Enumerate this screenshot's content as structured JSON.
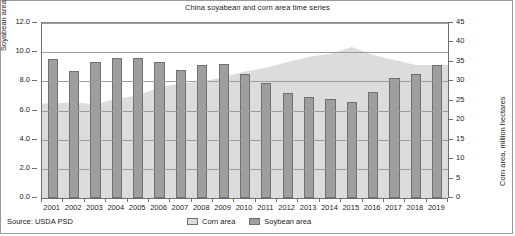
{
  "chart": {
    "title": "China soyabean and corn area time series",
    "source": "Source: USDA PSD",
    "legend": {
      "corn_label": "Corn area",
      "soybean_label": "Soybean area"
    },
    "axis_left_title": "Soyabean area, million hectares",
    "axis_right_title": "Corn area, million hectares",
    "colors": {
      "soybean_bar_fill": "#9e9e9e",
      "soybean_bar_border": "#707070",
      "corn_area_fill": "#dcdcdc",
      "gridline": "#9d9d9d",
      "axis": "#6e6e6e",
      "frame": "#9a9a9a",
      "background": "#ffffff"
    }
  },
  "chart_data": {
    "type": "bar",
    "title": "China soyabean and corn area time series",
    "xlabel": "",
    "ylabel": "Soyabean area, million hectares",
    "y2label": "Corn area, million hectares",
    "grid": true,
    "legend_position": "bottom-center",
    "categories": [
      "2001",
      "2002",
      "2003",
      "2004",
      "2005",
      "2006",
      "2007",
      "2008",
      "2009",
      "2010",
      "2011",
      "2012",
      "2013",
      "2014",
      "2015",
      "2016",
      "2017",
      "2018",
      "2019"
    ],
    "ylim": [
      0.0,
      12.0
    ],
    "yticks": [
      "0.0",
      "2.0",
      "4.0",
      "6.0",
      "8.0",
      "10.0",
      "12.0"
    ],
    "ytick_values": [
      0.0,
      2.0,
      4.0,
      6.0,
      8.0,
      10.0,
      12.0
    ],
    "y2lim": [
      0,
      45
    ],
    "y2ticks": [
      "0",
      "5",
      "10",
      "15",
      "20",
      "25",
      "30",
      "35",
      "40",
      "45"
    ],
    "y2tick_values": [
      0,
      5,
      10,
      15,
      20,
      25,
      30,
      35,
      40,
      45
    ],
    "series": [
      {
        "name": "Soybean area",
        "type": "bar",
        "axis": "left",
        "units": "million hectares",
        "color": "#9e9e9e",
        "values": [
          9.5,
          8.7,
          9.3,
          9.6,
          9.6,
          9.3,
          8.8,
          9.1,
          9.2,
          8.5,
          7.9,
          7.2,
          6.9,
          6.8,
          6.6,
          7.3,
          8.2,
          8.5,
          9.1
        ]
      },
      {
        "name": "Corn area",
        "type": "area",
        "axis": "right",
        "units": "million hectares",
        "color": "#dcdcdc",
        "values": [
          24.3,
          24.6,
          24.1,
          25.5,
          26.4,
          28.5,
          29.5,
          29.9,
          31.2,
          32.5,
          33.5,
          35.0,
          36.3,
          37.1,
          38.8,
          36.8,
          35.5,
          34.2,
          34.2
        ]
      }
    ]
  }
}
